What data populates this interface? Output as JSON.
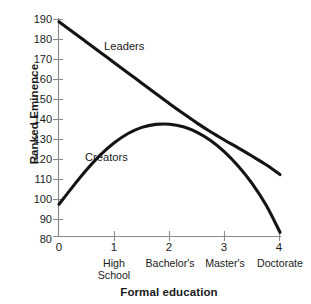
{
  "chart_data": {
    "type": "line",
    "title": "",
    "subtitle": "",
    "xlabel": "Formal education",
    "ylabel": "Ranked Eminence",
    "xlim": [
      0,
      4
    ],
    "ylim": [
      75,
      192
    ],
    "grid": false,
    "legend_position": "inline-annotation",
    "x_ticks": [
      {
        "value": 0,
        "label": "0",
        "sub": ""
      },
      {
        "value": 1,
        "label": "1",
        "sub": "High\nSchool"
      },
      {
        "value": 2,
        "label": "2",
        "sub": "Bachelor's"
      },
      {
        "value": 3,
        "label": "3",
        "sub": "Master's"
      },
      {
        "value": 4,
        "label": "4",
        "sub": "Doctorate"
      }
    ],
    "y_ticks": [
      80,
      90,
      100,
      110,
      120,
      130,
      140,
      150,
      160,
      170,
      180,
      190
    ],
    "x": [
      0,
      0.25,
      0.5,
      0.75,
      1,
      1.25,
      1.5,
      1.75,
      2,
      2.25,
      2.5,
      2.75,
      3,
      3.25,
      3.5,
      3.75,
      4
    ],
    "series": [
      {
        "name": "Leaders",
        "label": "Leaders",
        "color": "#141414",
        "values": [
          190,
          184.5,
          179,
          173.5,
          168,
          162.5,
          157,
          151.5,
          146,
          140.7,
          135.6,
          130.8,
          126.4,
          122.2,
          117.8,
          113.2,
          108
        ]
      },
      {
        "name": "Creators",
        "label": "Creators",
        "color": "#141414",
        "values": [
          92,
          101.5,
          110.5,
          118.5,
          125,
          130,
          133.3,
          134.9,
          135,
          133.6,
          130.6,
          126.1,
          120,
          112.3,
          103,
          91.5,
          77
        ]
      }
    ],
    "annotations": [
      {
        "text": "Leaders",
        "series": "Leaders"
      },
      {
        "text": "Creators",
        "series": "Creators"
      }
    ]
  },
  "axis": {
    "y_title": "Ranked Eminence",
    "x_title": "Formal education",
    "y_tick_labels": [
      "190",
      "180",
      "170",
      "160",
      "150",
      "140",
      "130",
      "120",
      "110",
      "100",
      "90",
      "80"
    ],
    "x_tick_labels": [
      "0",
      "1",
      "2",
      "3",
      "4"
    ],
    "x_sub_labels": [
      "",
      "High School",
      "Bachelor's",
      "Master's",
      "Doctorate"
    ],
    "x_sub_label_lines": [
      [
        "",
        ""
      ],
      [
        "High",
        "School"
      ],
      [
        "Bachelor's",
        ""
      ],
      [
        "Master's",
        ""
      ],
      [
        "Doctorate",
        ""
      ]
    ]
  },
  "series_labels": {
    "leaders": "Leaders",
    "creators": "Creators"
  },
  "colors": {
    "background": "#ffffff",
    "axis": "#8c8c8c",
    "curve": "#141414",
    "text": "#1a1a1a"
  }
}
